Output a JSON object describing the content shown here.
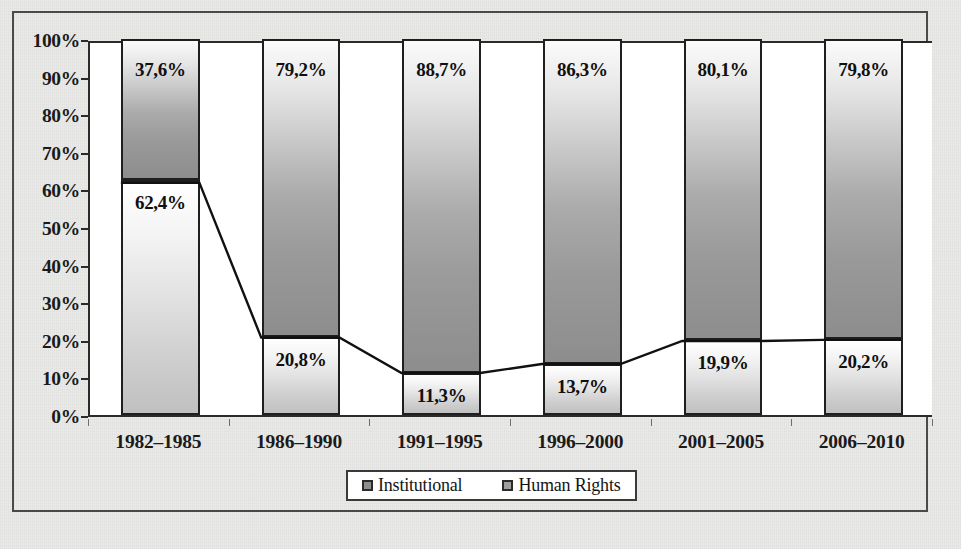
{
  "chart_data": {
    "type": "bar",
    "subtype": "100% stacked bar with connector line",
    "title": "",
    "subtitle": "",
    "xlabel": "",
    "ylabel": "",
    "categories": [
      "1982–1985",
      "1986–1990",
      "1991–1995",
      "1996–2000",
      "2001–2005",
      "2006–2010"
    ],
    "series": [
      {
        "name": "Institutional",
        "values": [
          37.6,
          79.2,
          88.7,
          86.3,
          80.1,
          79.8
        ],
        "labels": [
          "37,6%",
          "79,2%",
          "88,7%",
          "86,3%",
          "80,1%",
          "79,8%"
        ],
        "position": "top",
        "fill": "#a8a8a8"
      },
      {
        "name": "Human Rights",
        "values": [
          62.4,
          20.8,
          11.3,
          13.7,
          19.9,
          20.2
        ],
        "labels": [
          "62,4%",
          "20,8%",
          "11,3%",
          "13,7%",
          "19,9%",
          "20,2%"
        ],
        "position": "bottom",
        "fill": "#dcdcdc"
      }
    ],
    "connector_line": {
      "description": "line tracing the top of the Human Rights segment",
      "values": [
        62.4,
        20.8,
        11.3,
        13.7,
        19.9,
        20.2
      ],
      "color": "#111111"
    },
    "ylim": [
      0,
      100
    ],
    "ytick_step": 10,
    "ytick_labels": [
      "100%",
      "90%",
      "80%",
      "70%",
      "60%",
      "50%",
      "40%",
      "30%",
      "20%",
      "10%",
      "0%"
    ],
    "ytick_values": [
      100,
      90,
      80,
      70,
      60,
      50,
      40,
      30,
      20,
      10,
      0
    ],
    "grid": false,
    "legend": {
      "position": "bottom",
      "entries": [
        {
          "label": "Institutional",
          "marker": "square-swatch"
        },
        {
          "label": "Human Rights",
          "marker": "square-swatch"
        }
      ]
    },
    "colors": {
      "axis": "#2b2b2b",
      "frame": "#4a4a4a",
      "text": "#1a1a1a",
      "plot_background": "#ffffff",
      "page_background": "#e9e9e7",
      "institutional": "#a8a8a8",
      "human_rights": "#dcdcdc",
      "line": "#111111"
    }
  }
}
